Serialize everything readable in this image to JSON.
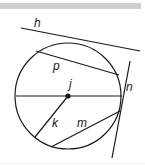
{
  "diagram": {
    "type": "circle-lines",
    "colors": {
      "stroke": "#1a1a1a",
      "bar": "#cfcfcf",
      "background": "#ffffff"
    },
    "circle": {
      "cx": 68,
      "cy": 96,
      "r": 53
    },
    "center_point": {
      "x": 68,
      "y": 96,
      "label": "j"
    },
    "lines": [
      {
        "id": "h",
        "label": "h",
        "kind": "tangent",
        "x1": 21,
        "y1": 28,
        "x2": 140,
        "y2": 51,
        "label_x": 34,
        "label_y": 27
      },
      {
        "id": "p",
        "label": "p",
        "kind": "chord",
        "x1": 36,
        "y1": 51,
        "x2": 119,
        "y2": 75,
        "label_x": 53,
        "label_y": 70
      },
      {
        "id": "diameter",
        "label": "",
        "kind": "diameter",
        "x1": 16,
        "y1": 96,
        "x2": 122,
        "y2": 96
      },
      {
        "id": "n",
        "label": "n",
        "kind": "tangent",
        "x1": 130,
        "y1": 61,
        "x2": 112,
        "y2": 158,
        "label_x": 126,
        "label_y": 91
      },
      {
        "id": "k",
        "label": "k",
        "kind": "radius",
        "x1": 68,
        "y1": 96,
        "x2": 35,
        "y2": 137,
        "label_x": 52,
        "label_y": 127
      },
      {
        "id": "m",
        "label": "m",
        "kind": "chord",
        "x1": 51,
        "y1": 147,
        "x2": 120,
        "y2": 111,
        "label_x": 77,
        "label_y": 127
      }
    ]
  }
}
